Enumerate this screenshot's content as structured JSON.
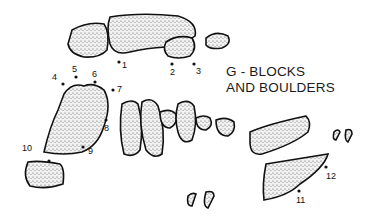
{
  "title": {
    "line1": "G - BLOCKS",
    "line2": "AND BOULDERS"
  },
  "point_labels": [
    "1",
    "2",
    "3",
    "4",
    "5",
    "6",
    "7",
    "8",
    "9",
    "10",
    "11",
    "12"
  ],
  "colors": {
    "ink": "#111111",
    "stipple": "#e8e8e8",
    "background": "#ffffff"
  }
}
